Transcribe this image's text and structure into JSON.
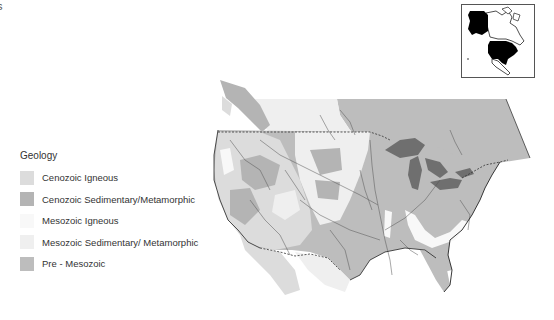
{
  "corner_label": "s",
  "legend": {
    "title": "Geology",
    "items": [
      {
        "label": "Cenozoic Igneous",
        "color": "#dcdcdc"
      },
      {
        "label": "Cenozoic Sedimentary/Metamorphic",
        "color": "#b4b4b4"
      },
      {
        "label": "Mesozoic Igneous",
        "color": "#f8f8f8"
      },
      {
        "label": "Mesozoic Sedimentary/ Metamorphic",
        "color": "#efefef"
      },
      {
        "label": "Pre - Mesozoic",
        "color": "#bdbdbd"
      }
    ]
  },
  "map": {
    "region": "Conterminous United States and southern Canada",
    "lake_color": "#6f6f6f",
    "river_color": "#555555",
    "border_style": "dashed"
  },
  "inset": {
    "description": "North America locator map with Alaska and conterminous US highlighted in black"
  }
}
